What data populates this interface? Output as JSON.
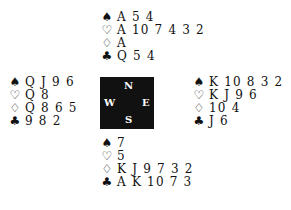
{
  "diagram": {
    "type": "bridge-deal",
    "symbols": {
      "spades": "♠",
      "hearts": "♡",
      "diamonds": "♢",
      "clubs": "♣"
    },
    "compass": {
      "north": "N",
      "south": "S",
      "west": "W",
      "east": "E"
    },
    "hands": {
      "north": {
        "spades": "A 5 4",
        "hearts": "A 10 7 4 3 2",
        "diamonds": "A",
        "clubs": "Q 5 4"
      },
      "west": {
        "spades": "Q J 9 6",
        "hearts": "Q 8",
        "diamonds": "Q 8 6 5",
        "clubs": "9 8 2"
      },
      "east": {
        "spades": "K 10 8 3 2",
        "hearts": "K J 9 6",
        "diamonds": "10 4",
        "clubs": "J 6"
      },
      "south": {
        "spades": "7",
        "hearts": "5",
        "diamonds": "K J 9 7 3 2",
        "clubs": "A K 10 7 3"
      }
    }
  }
}
